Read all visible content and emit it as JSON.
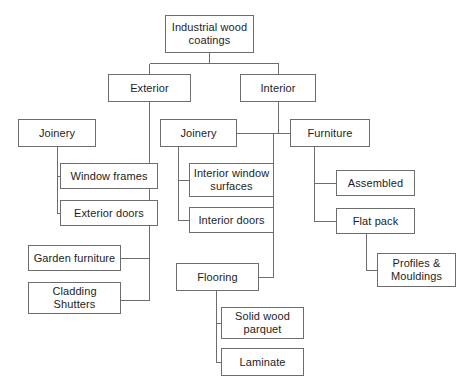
{
  "diagram": {
    "type": "tree",
    "title": "Industrial wood coatings",
    "orientation": "top-down",
    "background_color": "#ffffff",
    "box_border_color": "#6d6d6d",
    "connector_color": "#6d6d6d",
    "text_color": "#1d1d1d",
    "nodes": [
      {
        "id": "root",
        "label": "Industrial wood\ncoatings",
        "x": 165,
        "y": 15,
        "w": 89,
        "h": 38,
        "level": 0
      },
      {
        "id": "exterior",
        "label": "Exterior",
        "x": 108,
        "y": 74,
        "w": 83,
        "h": 28,
        "level": 1
      },
      {
        "id": "interior",
        "label": "Interior",
        "x": 240,
        "y": 74,
        "w": 76,
        "h": 28,
        "level": 1
      },
      {
        "id": "ext-joinery",
        "label": "Joinery",
        "x": 18,
        "y": 119,
        "w": 78,
        "h": 28,
        "level": 2
      },
      {
        "id": "int-joinery",
        "label": "Joinery",
        "x": 160,
        "y": 119,
        "w": 77,
        "h": 28,
        "level": 2
      },
      {
        "id": "furniture",
        "label": "Furniture",
        "x": 290,
        "y": 119,
        "w": 80,
        "h": 28,
        "level": 2
      },
      {
        "id": "window-frames",
        "label": "Window frames",
        "x": 60,
        "y": 163,
        "w": 98,
        "h": 26,
        "level": 3
      },
      {
        "id": "exterior-doors",
        "label": "Exterior doors",
        "x": 60,
        "y": 200,
        "w": 98,
        "h": 26,
        "level": 3
      },
      {
        "id": "int-window-surf",
        "label": "Interior window\nsurfaces",
        "x": 189,
        "y": 163,
        "w": 85,
        "h": 34,
        "level": 3
      },
      {
        "id": "interior-doors",
        "label": "Interior doors",
        "x": 189,
        "y": 207,
        "w": 85,
        "h": 26,
        "level": 3
      },
      {
        "id": "assembled",
        "label": "Assembled",
        "x": 336,
        "y": 170,
        "w": 79,
        "h": 26,
        "level": 3
      },
      {
        "id": "flat-pack",
        "label": "Flat pack",
        "x": 336,
        "y": 208,
        "w": 79,
        "h": 26,
        "level": 3
      },
      {
        "id": "profiles",
        "label": "Profiles &\nMouldings",
        "x": 377,
        "y": 253,
        "w": 79,
        "h": 34,
        "level": 4
      },
      {
        "id": "garden-furniture",
        "label": "Garden furniture",
        "x": 28,
        "y": 245,
        "w": 93,
        "h": 26,
        "level": 3
      },
      {
        "id": "cladding",
        "label": "Cladding\nShutters",
        "x": 28,
        "y": 282,
        "w": 93,
        "h": 32,
        "level": 3
      },
      {
        "id": "flooring",
        "label": "Flooring",
        "x": 176,
        "y": 263,
        "w": 83,
        "h": 28,
        "level": 3
      },
      {
        "id": "solid-wood",
        "label": "Solid wood\nparquet",
        "x": 221,
        "y": 307,
        "w": 83,
        "h": 32,
        "level": 4
      },
      {
        "id": "laminate",
        "label": "Laminate",
        "x": 221,
        "y": 348,
        "w": 83,
        "h": 28,
        "level": 4
      }
    ],
    "edges": [
      {
        "from": "root",
        "to": "exterior",
        "path": "M209,53 L209,63 M149,63 L278,63 M149,63 L149,74 M278,63 L278,74"
      },
      {
        "from": "root",
        "to": "interior",
        "path": ""
      },
      {
        "from": "exterior",
        "to": "branch",
        "path": "M149,102 L149,300"
      },
      {
        "from": "ext-joinery",
        "to": "window-frames",
        "path": "M57,147 L57,213 M57,176 L60,176 M57,213 L60,213"
      },
      {
        "from": "branch",
        "to": "garden-furniture",
        "path": "M121,258 L149,258"
      },
      {
        "from": "branch",
        "to": "cladding",
        "path": "M121,300 L149,300"
      },
      {
        "from": "interior",
        "to": "spine",
        "path": "M278,102 L278,133 M273,133 L273,277"
      },
      {
        "from": "spine",
        "to": "int-joinery",
        "path": "M237,133 L273,133"
      },
      {
        "from": "spine",
        "to": "furniture",
        "path": "M273,133 L290,133"
      },
      {
        "from": "int-joinery",
        "to": "children",
        "path": "M178,147 L178,220 M178,180 L189,180 M178,220 L189,220"
      },
      {
        "from": "spine",
        "to": "flooring",
        "path": "M259,277 L273,277"
      },
      {
        "from": "furniture",
        "to": "children",
        "path": "M314,147 L314,221 M314,183 L336,183 M314,221 L336,221"
      },
      {
        "from": "flat-pack",
        "to": "profiles",
        "path": "M366,234 L366,270 M366,270 L377,270"
      },
      {
        "from": "flooring",
        "to": "children",
        "path": "M216,291 L216,362 M216,323 L221,323 M216,362 L221,362"
      }
    ]
  }
}
